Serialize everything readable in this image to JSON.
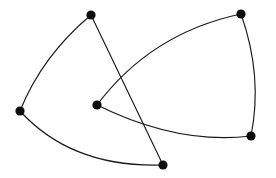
{
  "figure": {
    "name": "undirected-graph-drawing",
    "width": 276,
    "height": 178,
    "background_color": "#ffffff",
    "edge_color": "#1a1a1a",
    "vertex_color": "#0d0d0d",
    "edge_stroke_width": 1.15,
    "vertex_radius": 4.6,
    "vertex_count": 6,
    "edge_count": 6,
    "crossing_count": 2
  },
  "chart_data": {
    "type": "scatter",
    "title": "",
    "xlabel": "",
    "ylabel": "",
    "grid": false,
    "legend": "none",
    "xlim": [
      0,
      276
    ],
    "ylim": [
      178,
      0
    ],
    "nodes": [
      {
        "id": "v1",
        "label": "top-left",
        "x": 91,
        "y": 15,
        "r": 4.6
      },
      {
        "id": "v2",
        "label": "top-right",
        "x": 241,
        "y": 14,
        "r": 4.6
      },
      {
        "id": "v3",
        "label": "left",
        "x": 20,
        "y": 111,
        "r": 4.6
      },
      {
        "id": "v4",
        "label": "center",
        "x": 97,
        "y": 105,
        "r": 4.6
      },
      {
        "id": "v5",
        "label": "right",
        "x": 251,
        "y": 136,
        "r": 4.6
      },
      {
        "id": "v6",
        "label": "bottom",
        "x": 163,
        "y": 165,
        "r": 4.6
      }
    ],
    "edges": [
      {
        "id": "e1",
        "source": "v3",
        "target": "v1",
        "curve": "quadratic",
        "path": "M 20 111 Q 42 56 91 15"
      },
      {
        "id": "e2",
        "source": "v3",
        "target": "v6",
        "curve": "quadratic",
        "path": "M 20 111 Q 72 168 163 165"
      },
      {
        "id": "e3",
        "source": "v1",
        "target": "v6",
        "curve": "straight",
        "path": "M 91 15 L 163 165"
      },
      {
        "id": "e4",
        "source": "v4",
        "target": "v2",
        "curve": "quadratic",
        "path": "M 97 105 Q 151 33 241 14"
      },
      {
        "id": "e5",
        "source": "v4",
        "target": "v5",
        "curve": "quadratic",
        "path": "M 97 105 Q 178 145 251 136"
      },
      {
        "id": "e6",
        "source": "v2",
        "target": "v5",
        "curve": "quadratic",
        "path": "M 241 14 Q 263 76 251 136"
      }
    ],
    "crossings": [
      {
        "edges": [
          "e3",
          "e4"
        ],
        "x": 131,
        "y": 62
      },
      {
        "edges": [
          "e3",
          "e5"
        ],
        "x": 155,
        "y": 123
      }
    ]
  }
}
